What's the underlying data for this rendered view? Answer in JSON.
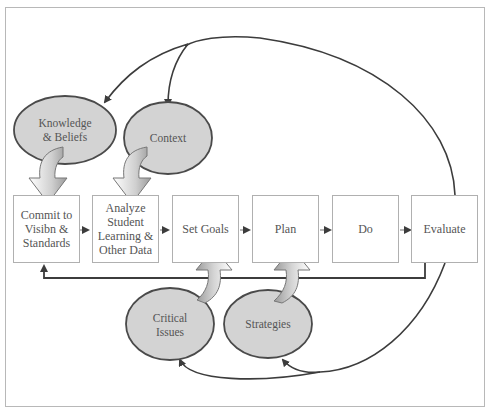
{
  "diagram": {
    "type": "process-cycle",
    "process_steps": [
      {
        "id": "commit",
        "label": "Commit to\nVisibn &\nStandards"
      },
      {
        "id": "analyze",
        "label": "Analyze\nStudent\nLearning &\nOther Data"
      },
      {
        "id": "set-goals",
        "label": "Set Goals"
      },
      {
        "id": "plan",
        "label": "Plan"
      },
      {
        "id": "do",
        "label": "Do"
      },
      {
        "id": "evaluate",
        "label": "Evaluate"
      }
    ],
    "inputs": [
      {
        "id": "knowledge-beliefs",
        "label": "Knowledge\n& Beliefs",
        "feeds": "commit"
      },
      {
        "id": "context",
        "label": "Context",
        "feeds": "analyze"
      },
      {
        "id": "critical-issues",
        "label": "Critical\nIssues",
        "feeds": "set-goals"
      },
      {
        "id": "strategies",
        "label": "Strategies",
        "feeds": "plan"
      }
    ],
    "feedback": [
      {
        "from": "evaluate",
        "to": "commit",
        "path": "bottom line"
      },
      {
        "from": "evaluate",
        "to": [
          "knowledge-beliefs",
          "context"
        ],
        "path": "top arc"
      },
      {
        "from": "evaluate",
        "to": [
          "critical-issues",
          "strategies"
        ],
        "path": "bottom arc"
      }
    ],
    "colors": {
      "ellipse_fill": "#d3d3d3",
      "ellipse_stroke": "#4a4a4a",
      "box_border": "#b0b0b0",
      "line": "#4a4a4a",
      "frame": "#b8b8b8"
    }
  }
}
